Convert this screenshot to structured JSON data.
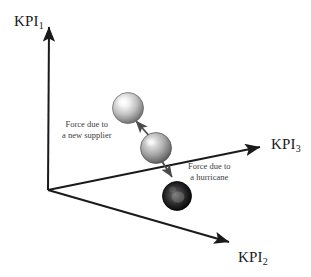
{
  "figure": {
    "type": "3d-axes-force-diagram",
    "background_color": "#ffffff",
    "axis_color": "#1a1a1a",
    "annotation_color": "#3d3d3d"
  },
  "axes": {
    "vertical": {
      "name": "KPI1",
      "label_main": "KPI",
      "label_sub": "1",
      "origin": [
        48,
        190
      ],
      "tip": [
        49,
        22
      ]
    },
    "right": {
      "name": "KPI3",
      "label_main": "KPI",
      "label_sub": "3",
      "origin": [
        48,
        190
      ],
      "tip": [
        266,
        146
      ]
    },
    "lower_right": {
      "name": "KPI2",
      "label_main": "KPI",
      "label_sub": "2",
      "origin": [
        48,
        190
      ],
      "tip": [
        235,
        245
      ]
    }
  },
  "spheres": [
    {
      "id": "sphere-upper-light",
      "shade": "light-gray",
      "center": [
        128,
        108
      ],
      "radius": 16,
      "fill_light": "#f2f2f2",
      "fill_mid": "#b8b8b8",
      "fill_dark": "#6e6e6e"
    },
    {
      "id": "sphere-middle-medium",
      "shade": "medium-gray",
      "center": [
        156,
        148
      ],
      "radius": 16,
      "fill_light": "#e0e0e0",
      "fill_mid": "#9a9a9a",
      "fill_dark": "#5a5a5a"
    },
    {
      "id": "sphere-lower-dark",
      "shade": "dark",
      "center": [
        177,
        196
      ],
      "radius": 15,
      "fill_light": "#6a6a6a",
      "fill_mid": "#2b2b2b",
      "fill_dark": "#050505"
    }
  ],
  "force_vectors": [
    {
      "id": "force-new-supplier",
      "from": [
        152,
        138
      ],
      "to": [
        133,
        118
      ],
      "label_line1": "Force due to",
      "label_line2": "a new supplier"
    },
    {
      "id": "force-hurricane",
      "from": [
        158,
        156
      ],
      "to": [
        174,
        180
      ],
      "label_line1": "Force due to",
      "label_line2": "a hurricane"
    }
  ],
  "annotations": {
    "supplier": {
      "line1": "Force due to",
      "line2": "a new supplier"
    },
    "hurricane": {
      "line1": "Force due to",
      "line2": "a hurricane"
    }
  }
}
